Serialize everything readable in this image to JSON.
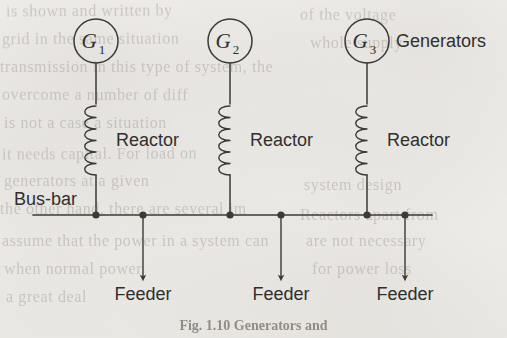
{
  "figure": {
    "caption": "Fig. 1.10   Generators and",
    "background_color": "#f2f0ed",
    "ink_color": "#3a3a3a",
    "canvas": {
      "width": 507,
      "height": 338
    }
  },
  "labels": {
    "generators": "Generators",
    "busbar": "Bus-bar",
    "reactor": "Reactor",
    "feeder": "Feeder"
  },
  "generators": [
    {
      "id": "g1",
      "label": "G",
      "subscript": "1",
      "cx": 96,
      "cy": 41,
      "r": 22
    },
    {
      "id": "g2",
      "label": "G",
      "subscript": "2",
      "cx": 230,
      "cy": 41,
      "r": 22
    },
    {
      "id": "g3",
      "label": "G",
      "subscript": "3",
      "cx": 367,
      "cy": 41,
      "r": 22
    }
  ],
  "reactors": [
    {
      "id": "reactor-1",
      "x": 96,
      "label": "Reactor",
      "label_x": 116,
      "label_y": 146,
      "coil_top": 106,
      "coil_bottom": 175,
      "loops": 6
    },
    {
      "id": "reactor-2",
      "x": 230,
      "label": "Reactor",
      "label_x": 250,
      "label_y": 146,
      "coil_top": 106,
      "coil_bottom": 175,
      "loops": 6
    },
    {
      "id": "reactor-3",
      "x": 367,
      "label": "Reactor",
      "label_x": 387,
      "label_y": 146,
      "coil_top": 106,
      "coil_bottom": 175,
      "loops": 6
    }
  ],
  "busbar": {
    "y": 215,
    "x_start": 33,
    "x_end": 432,
    "label_x": 14,
    "label_y": 205,
    "nodes": [
      {
        "id": "node-g1",
        "x": 96,
        "type": "generator"
      },
      {
        "id": "node-feeder1",
        "x": 143,
        "type": "feeder"
      },
      {
        "id": "node-g2",
        "x": 230,
        "type": "generator"
      },
      {
        "id": "node-feeder2",
        "x": 281,
        "type": "feeder"
      },
      {
        "id": "node-g3",
        "x": 367,
        "type": "generator"
      },
      {
        "id": "node-feeder3",
        "x": 405,
        "type": "feeder"
      }
    ]
  },
  "feeders": [
    {
      "id": "feeder-1",
      "x": 143,
      "y_top": 215,
      "y_arrow": 278,
      "label": "Feeder",
      "label_x": 143,
      "label_y": 300
    },
    {
      "id": "feeder-2",
      "x": 281,
      "y_top": 215,
      "y_arrow": 278,
      "label": "Feeder",
      "label_x": 281,
      "label_y": 300
    },
    {
      "id": "feeder-3",
      "x": 405,
      "y_top": 215,
      "y_arrow": 278,
      "label": "Feeder",
      "label_x": 405,
      "label_y": 300
    }
  ],
  "generators_label": {
    "x": 396,
    "y": 47
  },
  "ghost_text": [
    {
      "text": "is shown and written by",
      "x": 6,
      "y": 2,
      "size": 16,
      "rot": -0.4
    },
    {
      "text": "grid in the same situation",
      "x": 2,
      "y": 30,
      "size": 16,
      "rot": -0.2
    },
    {
      "text": "transmission in this type of system, the",
      "x": 0,
      "y": 58,
      "size": 16,
      "rot": 0
    },
    {
      "text": "overcome a number of diff",
      "x": 2,
      "y": 86,
      "size": 16,
      "rot": 0.2
    },
    {
      "text": "is not a case a situation",
      "x": 4,
      "y": 114,
      "size": 16,
      "rot": 0
    },
    {
      "text": "it needs capital. For load on",
      "x": 2,
      "y": 145,
      "size": 16,
      "rot": -0.3
    },
    {
      "text": "generators at a given",
      "x": 4,
      "y": 172,
      "size": 16,
      "rot": 0
    },
    {
      "text": "the other hand, there are several im",
      "x": 0,
      "y": 200,
      "size": 16,
      "rot": 0
    },
    {
      "text": "assume that the power in a system can",
      "x": 2,
      "y": 232,
      "size": 16,
      "rot": 0
    },
    {
      "text": "when normal power",
      "x": 4,
      "y": 260,
      "size": 16,
      "rot": 0
    },
    {
      "text": "a great deal",
      "x": 6,
      "y": 288,
      "size": 16,
      "rot": 0
    },
    {
      "text": "of the voltage",
      "x": 300,
      "y": 6,
      "size": 16,
      "rot": 0.3
    },
    {
      "text": "whole supply",
      "x": 310,
      "y": 34,
      "size": 16,
      "rot": 0
    },
    {
      "text": "system design",
      "x": 304,
      "y": 176,
      "size": 16,
      "rot": 0
    },
    {
      "text": "Reactors apart from",
      "x": 300,
      "y": 206,
      "size": 16,
      "rot": 0
    },
    {
      "text": "are not necessary",
      "x": 306,
      "y": 232,
      "size": 16,
      "rot": 0
    },
    {
      "text": "for power loss",
      "x": 312,
      "y": 260,
      "size": 16,
      "rot": 0
    }
  ]
}
